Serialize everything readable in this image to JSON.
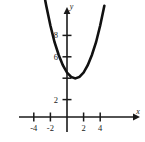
{
  "figure": {
    "name": "parabola-graph",
    "background_color": "#ffffff",
    "curve_color": "#111111",
    "axis_color": "#1a1a1a"
  },
  "axes": {
    "x_axis_label": "x",
    "y_axis_label": "y",
    "x_tick_labels": [
      "-4",
      "-2",
      "2",
      "4"
    ],
    "y_tick_labels": [
      "8",
      "6",
      "2"
    ]
  },
  "chart_data": {
    "type": "line",
    "title": "",
    "subtitle": "",
    "xlabel": "x",
    "ylabel": "y",
    "xlim": [
      -4.6,
      5.4
    ],
    "ylim": [
      -0.6,
      11.2
    ],
    "grid": false,
    "legend": null,
    "x_ticks": [
      -4,
      -2,
      2,
      4
    ],
    "x_tick_labels": [
      "-4",
      "-2",
      "2",
      "4"
    ],
    "y_ticks": [
      8,
      6,
      2
    ],
    "y_tick_labels": [
      "8",
      "6",
      "2"
    ],
    "equation": "y = 0.55(x - 1)^2 + 3.6",
    "vertex": [
      1,
      3.6
    ],
    "y_intercept": 4.15,
    "series": [
      {
        "name": "parabola",
        "color": "#111111",
        "x": [
          -3.5,
          -3.0,
          -2.5,
          -2.0,
          -1.5,
          -1.0,
          -0.5,
          0.0,
          0.5,
          1.0,
          1.5,
          2.0,
          2.5,
          3.0,
          3.5,
          4.0,
          4.5
        ],
        "y": [
          14.7,
          12.4,
          10.4,
          8.55,
          6.99,
          5.8,
          4.84,
          4.15,
          3.74,
          3.6,
          3.74,
          4.15,
          4.84,
          5.8,
          6.99,
          8.55,
          10.4
        ]
      }
    ]
  }
}
